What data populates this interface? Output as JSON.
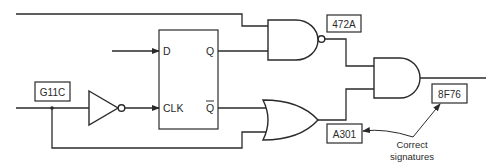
{
  "diagram": {
    "type": "logic-circuit-signature-analysis",
    "flip_flop": {
      "pins": {
        "d": "D",
        "q": "Q",
        "clk": "CLK",
        "q_bar": "Q"
      }
    },
    "gates": [
      {
        "id": "inverter",
        "type": "NOT"
      },
      {
        "id": "nand",
        "type": "NAND"
      },
      {
        "id": "or",
        "type": "OR"
      },
      {
        "id": "and",
        "type": "AND"
      }
    ],
    "signatures": {
      "input_node": "G11C",
      "nand_output": "472A",
      "or_output": "A301",
      "and_output": "8F76"
    },
    "annotation": {
      "line1": "Correct",
      "line2": "signatures"
    },
    "colors": {
      "line": "#2a2a2a",
      "background": "#ffffff"
    }
  }
}
